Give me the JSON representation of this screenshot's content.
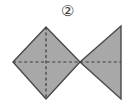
{
  "figure": {
    "label": "②",
    "label_plain": "2",
    "background_color": "#ffffff",
    "shape_fill_color": "#a8a8a8",
    "shape_stroke_color": "#4a4a4a",
    "dash_color": "#3c3c3c",
    "canvas": {
      "width": 134,
      "height": 105
    },
    "shapes": [
      {
        "name": "left-diamond",
        "type": "polygon",
        "description": "gray square rotated 45 degrees (diamond)",
        "points": "13,62 46,27 80,62 46,99"
      },
      {
        "name": "right-triangle",
        "type": "polygon",
        "description": "gray triangle pointing left, vertical right edge",
        "points": "80,62 121,26 121,99"
      }
    ],
    "fold_lines": [
      {
        "name": "vertical-fold-line",
        "type": "dashed-line",
        "x1": 46,
        "y1": 27,
        "x2": 46,
        "y2": 99
      },
      {
        "name": "horizontal-fold-line",
        "type": "dashed-line",
        "x1": 13,
        "y1": 62,
        "x2": 121,
        "y2": 62
      }
    ]
  }
}
